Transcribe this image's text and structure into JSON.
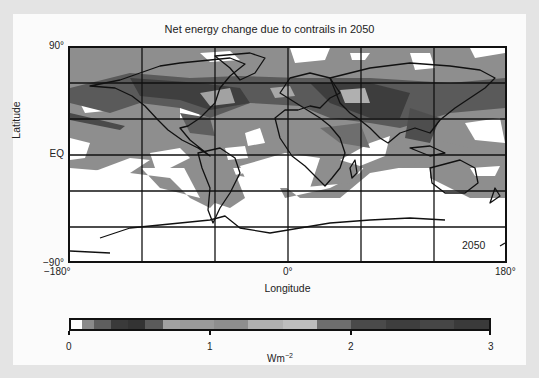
{
  "chart_data": {
    "type": "heatmap",
    "title": "Net energy change due to contrails in 2050",
    "subtitle": "",
    "xlabel": "Longitude",
    "ylabel": "Latitude",
    "x_ticks": [
      "−180°",
      "0°",
      "180°"
    ],
    "y_ticks": [
      "90°",
      "EQ",
      "−90°"
    ],
    "xlim": [
      -180,
      180
    ],
    "ylim": [
      -90,
      90
    ],
    "grid": true,
    "grid_x_lines": [
      -180,
      -120,
      -60,
      0,
      60,
      120,
      180
    ],
    "grid_y_lines": [
      90,
      60,
      30,
      0,
      -30,
      -60,
      -90
    ],
    "annotation": "2050",
    "projection": "equirectangular world map with coastlines",
    "colorbar": {
      "label": "Wm⁻²",
      "unit_base": "Wm",
      "unit_exponent": "−2",
      "min": 0,
      "max": 3,
      "ticks": [
        "0",
        "1",
        "2",
        "3"
      ],
      "orientation": "horizontal",
      "position": "bottom",
      "colors": [
        "#ffffff",
        "#8a8a8a",
        "#5e5e5e",
        "#3a3a3a",
        "#333333",
        "#5a5a5a",
        "#a2a2a2",
        "#9a9a9a",
        "#8e8e8e",
        "#b0b0b0",
        "#bdbdbd",
        "#6e6e6e",
        "#4a4a4a",
        "#3e3e3e",
        "#464646",
        "#3a3a3a"
      ]
    },
    "regions_description": [
      {
        "region": "Northern hemisphere mid-latitudes (30N-60N)",
        "level": "high",
        "approx_value": 2.0
      },
      {
        "region": "North Atlantic flight corridor",
        "level": "high",
        "approx_value": 2.2
      },
      {
        "region": "Europe / East Asia",
        "level": "high",
        "approx_value": 2.3
      },
      {
        "region": "Tropics (30S-30N)",
        "level": "moderate",
        "approx_value": 0.5
      },
      {
        "region": "Southern ocean (south of 40S)",
        "level": "near zero",
        "approx_value": 0.0
      },
      {
        "region": "Antarctica",
        "level": "near zero",
        "approx_value": 0.0
      }
    ]
  },
  "title": "Net energy change due to contrails in 2050",
  "axes": {
    "y_top": "90°",
    "y_mid": "EQ",
    "y_bottom": "−90°",
    "x_left": "−180°",
    "x_mid": "0°",
    "x_right": "180°",
    "xlabel": "Longitude",
    "ylabel": "Latitude"
  },
  "annotation": "2050",
  "colorbar": {
    "ticks": [
      "0",
      "1",
      "2",
      "3"
    ],
    "unit_base": "Wm",
    "unit_exp": "−2"
  }
}
